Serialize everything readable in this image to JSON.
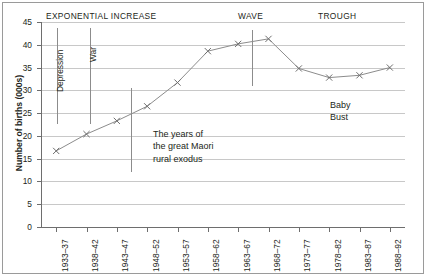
{
  "chart_data": {
    "type": "line",
    "title": "",
    "xlabel": "",
    "ylabel": "Number of births (000s)",
    "categories": [
      "1933–37",
      "1938–42",
      "1943–47",
      "1948–52",
      "1953–57",
      "1958–62",
      "1963–67",
      "1968–72",
      "1973–77",
      "1978–82",
      "1983–87",
      "1988–92"
    ],
    "values": [
      16.7,
      20.4,
      23.3,
      26.5,
      31.7,
      38.6,
      40.2,
      41.3,
      34.8,
      32.8,
      33.3,
      35.0
    ],
    "ylim": [
      0,
      45
    ],
    "ytick_step": 5,
    "yticks": [
      "45",
      "40",
      "35",
      "30",
      "25",
      "20",
      "15",
      "10",
      "5",
      "0"
    ],
    "grid": true,
    "legend": "none",
    "marker": "x",
    "line_color": "#8c8c8c",
    "marker_color": "#6e6e6e",
    "grid_color": "#c8c8c8",
    "axis_color": "#6e6e6e"
  },
  "period_headers": {
    "exponential": "EXPONENTIAL INCREASE",
    "wave": "WAVE",
    "trough": "TROUGH"
  },
  "annotations": {
    "depression": "Depression",
    "war": "War",
    "exodus_line1": "The years of",
    "exodus_line2": "the great Maori",
    "exodus_line3": "rural exodus",
    "baby": "Baby",
    "bust": "Bust"
  }
}
